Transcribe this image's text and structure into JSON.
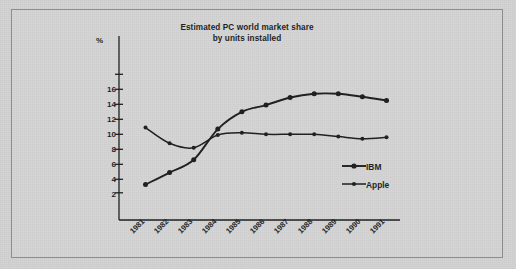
{
  "figure": {
    "background_color": "#d2d2d2",
    "frame_color": "#8d8d8d",
    "ink_color": "#1d1d1d"
  },
  "chart_data": {
    "type": "line",
    "title": "Estimated PC world market share",
    "subtitle": "by units installed",
    "title_lines": [
      "Estimated PC world market share",
      "by units installed"
    ],
    "xlabel": "",
    "ylabel": "%",
    "categories": [
      "1981",
      "1982",
      "1983",
      "1984",
      "1985",
      "1986",
      "1987",
      "1988",
      "1989",
      "1990",
      "1991"
    ],
    "x": [
      1981,
      1982,
      1983,
      1984,
      1985,
      1986,
      1987,
      1988,
      1989,
      1990,
      1991
    ],
    "yticks": [
      2,
      4,
      6,
      8,
      10,
      12,
      14,
      16
    ],
    "ytick_labels": [
      "2",
      "4",
      "6",
      "8",
      "10",
      "12",
      "14",
      "16"
    ],
    "ylim": [
      0,
      17.5
    ],
    "grid": false,
    "legend_position": "inside-right",
    "series": [
      {
        "name": "IBM",
        "color": "#1d1d1d",
        "marker": "circle",
        "values": [
          1.3,
          2.9,
          4.6,
          8.7,
          11.0,
          11.9,
          12.9,
          13.4,
          13.4,
          13.0,
          12.5
        ]
      },
      {
        "name": "Apple",
        "color": "#1d1d1d",
        "marker": "circle",
        "values": [
          8.9,
          6.8,
          6.2,
          7.9,
          8.2,
          8.0,
          8.0,
          8.0,
          7.7,
          7.4,
          7.6
        ]
      }
    ]
  },
  "legend": {
    "items": [
      {
        "label": "IBM"
      },
      {
        "label": "Apple"
      }
    ]
  },
  "axis": {
    "percent_symbol": "%"
  }
}
